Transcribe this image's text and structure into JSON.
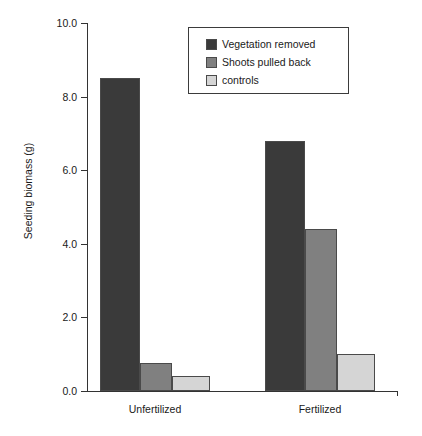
{
  "chart_data": {
    "type": "bar",
    "title": "",
    "xlabel": "",
    "ylabel": "Seeding biomass (g)",
    "ylim": [
      0.0,
      10.0
    ],
    "yticks": [
      "0.0",
      "2.0",
      "4.0",
      "6.0",
      "8.0",
      "10.0"
    ],
    "ytick_values": [
      0.0,
      2.0,
      4.0,
      6.0,
      8.0,
      10.0
    ],
    "grid": false,
    "legend_position": "top-center",
    "categories": [
      "Unfertilized",
      "Fertilized"
    ],
    "series": [
      {
        "name": "Vegetation removed",
        "color": "#3a3a3a",
        "values": [
          8.5,
          6.8
        ]
      },
      {
        "name": "Shoots pulled back",
        "color": "#808080",
        "values": [
          0.75,
          4.4
        ]
      },
      {
        "name": "controls",
        "color": "#d5d5d5",
        "values": [
          0.42,
          1.0
        ]
      }
    ]
  },
  "legend": {
    "items": [
      {
        "label": "Vegetation removed",
        "swatch": "#3a3a3a"
      },
      {
        "label": "Shoots pulled back",
        "swatch": "#808080"
      },
      {
        "label": "controls",
        "swatch": "#d5d5d5"
      }
    ]
  },
  "axis": {
    "y_title": "Seeding biomass (g)",
    "y_tick_labels": [
      "10.0",
      "8.0",
      "6.0",
      "4.0",
      "2.0",
      "0.0"
    ],
    "x_tick_labels": [
      "Unfertilized",
      "Fertilized"
    ]
  },
  "colors": {
    "axis": "#333333",
    "text": "#1a1a1a",
    "background": "#ffffff",
    "bar_outline": "#4a4a4a"
  }
}
